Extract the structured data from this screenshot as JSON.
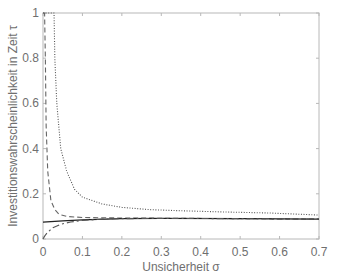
{
  "chart_data": {
    "type": "line",
    "title": "",
    "xlabel": "Unsicherheit σ",
    "ylabel": "Investitionswahrscheinlichkeit in Zeit τ",
    "xlim": [
      0,
      0.7
    ],
    "ylim": [
      0,
      1
    ],
    "grid": false,
    "legend": null,
    "xticks": [
      "0",
      "0.1",
      "0.2",
      "0.3",
      "0.4",
      "0.5",
      "0.6",
      "0.7"
    ],
    "yticks": [
      "0",
      "0.2",
      "0.4",
      "0.6",
      "0.8",
      "1"
    ],
    "series": [
      {
        "name": "dotted",
        "style": "dotted",
        "color": "#555555",
        "x": [
          0.0,
          0.028,
          0.03,
          0.035,
          0.045,
          0.06,
          0.08,
          0.1,
          0.15,
          0.2,
          0.27,
          0.35,
          0.45,
          0.575,
          0.7
        ],
        "y": [
          1.0,
          1.0,
          0.8,
          0.6,
          0.4,
          0.3,
          0.22,
          0.185,
          0.155,
          0.14,
          0.13,
          0.125,
          0.12,
          0.115,
          0.106
        ]
      },
      {
        "name": "dashed",
        "style": "dashed",
        "color": "#666666",
        "x": [
          0.0,
          0.004,
          0.006,
          0.008,
          0.012,
          0.02,
          0.03,
          0.04,
          0.06,
          0.1,
          0.2,
          0.3,
          0.5,
          0.7
        ],
        "y": [
          1.0,
          1.0,
          0.8,
          0.5,
          0.3,
          0.17,
          0.13,
          0.11,
          0.1,
          0.095,
          0.093,
          0.092,
          0.09,
          0.088
        ]
      },
      {
        "name": "solid",
        "style": "solid",
        "color": "#222222",
        "x": [
          0.0,
          0.05,
          0.1,
          0.2,
          0.3,
          0.5,
          0.7
        ],
        "y": [
          0.075,
          0.08,
          0.085,
          0.09,
          0.091,
          0.09,
          0.088
        ]
      },
      {
        "name": "dash-dot",
        "style": "dashdot",
        "color": "#555555",
        "x": [
          0.0,
          0.005,
          0.012,
          0.025,
          0.045,
          0.07,
          0.1,
          0.15,
          0.2,
          0.3,
          0.5,
          0.7
        ],
        "y": [
          0.0,
          0.015,
          0.03,
          0.05,
          0.065,
          0.075,
          0.082,
          0.088,
          0.09,
          0.091,
          0.09,
          0.088
        ]
      }
    ]
  }
}
